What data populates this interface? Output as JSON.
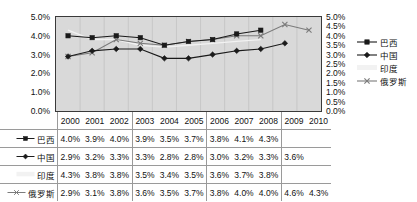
{
  "chart_data": {
    "type": "line",
    "title": "",
    "xlabel": "",
    "ylabel": "",
    "categories": [
      "2000",
      "2001",
      "2002",
      "2003",
      "2004",
      "2005",
      "2006",
      "2007",
      "2008",
      "2009",
      "2010"
    ],
    "ylim": [
      0,
      5
    ],
    "grid": true,
    "legend_position": "right",
    "left_axis_ticks": [
      "5.0%",
      "4.0%",
      "3.0%",
      "2.0%",
      "1.0%",
      "0.0%"
    ],
    "right_axis_ticks": [
      "5.0%",
      "4.5%",
      "4.0%",
      "3.5%",
      "3.0%",
      "2.5%",
      "2.0%",
      "1.5%",
      "1.0%",
      "0.5%",
      "0.0%"
    ],
    "series": [
      {
        "name": "巴西",
        "marker": "square",
        "color": "#1a1a1a",
        "values": [
          4.0,
          3.9,
          4.0,
          3.9,
          3.5,
          3.7,
          3.8,
          4.1,
          4.3,
          null,
          null
        ],
        "labels": [
          "4.0%",
          "3.9%",
          "4.0%",
          "3.9%",
          "3.5%",
          "3.7%",
          "3.8%",
          "4.1%",
          "4.3%",
          "",
          ""
        ]
      },
      {
        "name": "中国",
        "marker": "diamond",
        "color": "#1a1a1a",
        "values": [
          2.9,
          3.2,
          3.3,
          3.3,
          2.8,
          2.8,
          3.0,
          3.2,
          3.3,
          3.6,
          null
        ],
        "labels": [
          "2.9%",
          "3.2%",
          "3.3%",
          "3.3%",
          "2.8%",
          "2.8%",
          "3.0%",
          "3.2%",
          "3.3%",
          "3.6%",
          ""
        ]
      },
      {
        "name": "印度",
        "marker": "none",
        "color": "#f2f2f2",
        "values": [
          4.3,
          3.8,
          3.8,
          3.5,
          3.4,
          3.5,
          3.6,
          3.7,
          3.8,
          null,
          null
        ],
        "labels": [
          "4.3%",
          "3.8%",
          "3.8%",
          "3.5%",
          "3.4%",
          "3.5%",
          "3.6%",
          "3.7%",
          "3.8%",
          "",
          ""
        ]
      },
      {
        "name": "俄罗斯",
        "marker": "cross",
        "color": "#7a7a7a",
        "values": [
          2.9,
          3.1,
          3.8,
          3.6,
          3.5,
          3.7,
          3.8,
          4.0,
          4.0,
          4.6,
          4.3
        ],
        "labels": [
          "2.9%",
          "3.1%",
          "3.8%",
          "3.6%",
          "3.5%",
          "3.7%",
          "3.8%",
          "4.0%",
          "4.0%",
          "4.6%",
          "4.3%"
        ]
      }
    ]
  },
  "colors": {
    "plot_background": "#d9d9d9",
    "plot_border": "#3a3a3a",
    "grid": "#c2c2c2",
    "table_border": "#9a9a9a",
    "text": "#111111"
  }
}
